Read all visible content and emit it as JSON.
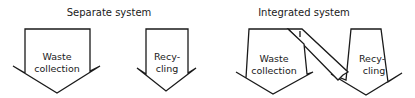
{
  "separate": {
    "title": "Separate system",
    "waste": {
      "line1": "Waste",
      "line2": "collection"
    },
    "recycling": {
      "line1": "Recy-",
      "line2": "cling"
    }
  },
  "integrated": {
    "title": "Integrated system",
    "waste": {
      "line1": "Waste",
      "line2": "collection"
    },
    "recycling": {
      "line1": "Recy-",
      "line2": "cling"
    }
  },
  "colors": {
    "stroke": "#1a1a1a",
    "background": "#ffffff"
  }
}
